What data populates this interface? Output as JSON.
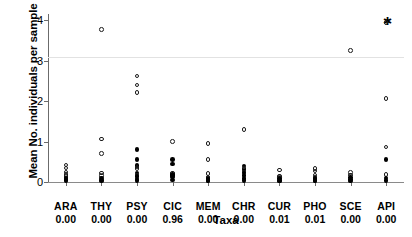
{
  "chart_data": {
    "type": "scatter",
    "title": "",
    "xlabel": "Taxa",
    "ylabel": "Mean No. individuals per sample",
    "ylim": [
      0,
      4.15
    ],
    "yticks": [
      0,
      1,
      2,
      3,
      4
    ],
    "ytick_labels": [
      "0",
      "1",
      "2",
      "3",
      "4"
    ],
    "grid": "single faint horizontal reference line at y = 3.08",
    "gridlines": [
      3.08
    ],
    "legend": "none",
    "legend_position": "none",
    "marker_styles": {
      "open": "open circle",
      "filled": "filled circle",
      "star": "asterisk"
    },
    "categories": [
      "ARA",
      "THY",
      "PSY",
      "CIC",
      "MEM",
      "CHR",
      "CUR",
      "PHO",
      "SCE",
      "API"
    ],
    "category_values": [
      "0.00",
      "0.00",
      "0.00",
      "0.96",
      "0.00",
      "0.00",
      "0.01",
      "0.01",
      "0.00",
      "0.00"
    ],
    "series": [
      {
        "name": "ARA",
        "points": [
          {
            "y": 0.42,
            "style": "open"
          },
          {
            "y": 0.35,
            "style": "open"
          },
          {
            "y": 0.25,
            "style": "open"
          },
          {
            "y": 0.19,
            "style": "open"
          },
          {
            "y": 0.13,
            "style": "open"
          },
          {
            "y": 0.1,
            "style": "filled"
          },
          {
            "y": 0.06,
            "style": "filled"
          },
          {
            "y": 0.03,
            "style": "filled"
          }
        ]
      },
      {
        "name": "THY",
        "points": [
          {
            "y": 3.76,
            "style": "open"
          },
          {
            "y": 1.06,
            "style": "open"
          },
          {
            "y": 0.7,
            "style": "open"
          },
          {
            "y": 0.22,
            "style": "open"
          },
          {
            "y": 0.16,
            "style": "open"
          },
          {
            "y": 0.1,
            "style": "filled"
          },
          {
            "y": 0.05,
            "style": "filled"
          },
          {
            "y": 0.02,
            "style": "filled"
          }
        ]
      },
      {
        "name": "PSY",
        "points": [
          {
            "y": 2.62,
            "style": "open"
          },
          {
            "y": 2.4,
            "style": "open"
          },
          {
            "y": 2.21,
            "style": "open"
          },
          {
            "y": 0.8,
            "style": "filled"
          },
          {
            "y": 0.55,
            "style": "filled"
          },
          {
            "y": 0.41,
            "style": "filled"
          },
          {
            "y": 0.37,
            "style": "open"
          },
          {
            "y": 0.33,
            "style": "open"
          },
          {
            "y": 0.22,
            "style": "filled"
          },
          {
            "y": 0.17,
            "style": "open"
          },
          {
            "y": 0.13,
            "style": "filled"
          },
          {
            "y": 0.07,
            "style": "filled"
          },
          {
            "y": 0.03,
            "style": "filled"
          }
        ]
      },
      {
        "name": "CIC",
        "points": [
          {
            "y": 1.0,
            "style": "open"
          },
          {
            "y": 0.55,
            "style": "filled"
          },
          {
            "y": 0.44,
            "style": "filled"
          },
          {
            "y": 0.22,
            "style": "open"
          },
          {
            "y": 0.18,
            "style": "filled"
          },
          {
            "y": 0.16,
            "style": "filled"
          },
          {
            "y": 0.12,
            "style": "filled"
          },
          {
            "y": 0.05,
            "style": "filled"
          }
        ]
      },
      {
        "name": "MEM",
        "points": [
          {
            "y": 0.95,
            "style": "open"
          },
          {
            "y": 0.55,
            "style": "open"
          },
          {
            "y": 0.21,
            "style": "open"
          },
          {
            "y": 0.12,
            "style": "open"
          },
          {
            "y": 0.08,
            "style": "filled"
          },
          {
            "y": 0.04,
            "style": "filled"
          },
          {
            "y": 0.02,
            "style": "filled"
          }
        ]
      },
      {
        "name": "CHR",
        "points": [
          {
            "y": 1.3,
            "style": "open"
          },
          {
            "y": 0.4,
            "style": "filled"
          },
          {
            "y": 0.33,
            "style": "open"
          },
          {
            "y": 0.3,
            "style": "filled"
          },
          {
            "y": 0.25,
            "style": "open"
          },
          {
            "y": 0.22,
            "style": "filled"
          },
          {
            "y": 0.16,
            "style": "filled"
          },
          {
            "y": 0.09,
            "style": "filled"
          },
          {
            "y": 0.04,
            "style": "filled"
          }
        ]
      },
      {
        "name": "CUR",
        "points": [
          {
            "y": 0.3,
            "style": "open"
          },
          {
            "y": 0.15,
            "style": "open"
          },
          {
            "y": 0.11,
            "style": "open"
          },
          {
            "y": 0.08,
            "style": "filled"
          },
          {
            "y": 0.04,
            "style": "filled"
          },
          {
            "y": 0.02,
            "style": "filled"
          }
        ]
      },
      {
        "name": "PHO",
        "points": [
          {
            "y": 0.33,
            "style": "open"
          },
          {
            "y": 0.27,
            "style": "open"
          },
          {
            "y": 0.17,
            "style": "open"
          },
          {
            "y": 0.12,
            "style": "open"
          },
          {
            "y": 0.08,
            "style": "filled"
          },
          {
            "y": 0.04,
            "style": "filled"
          },
          {
            "y": 0.02,
            "style": "filled"
          }
        ]
      },
      {
        "name": "SCE",
        "points": [
          {
            "y": 3.25,
            "style": "open"
          },
          {
            "y": 0.23,
            "style": "open"
          },
          {
            "y": 0.17,
            "style": "open"
          },
          {
            "y": 0.11,
            "style": "filled"
          },
          {
            "y": 0.06,
            "style": "filled"
          },
          {
            "y": 0.02,
            "style": "filled"
          }
        ]
      },
      {
        "name": "API",
        "points": [
          {
            "y": 3.96,
            "style": "star"
          },
          {
            "y": 3.94,
            "style": "open"
          },
          {
            "y": 2.06,
            "style": "open"
          },
          {
            "y": 0.86,
            "style": "open"
          },
          {
            "y": 0.55,
            "style": "filled"
          },
          {
            "y": 0.18,
            "style": "open"
          },
          {
            "y": 0.1,
            "style": "filled"
          },
          {
            "y": 0.04,
            "style": "filled"
          }
        ]
      }
    ]
  },
  "colors": {
    "marker": "#000000",
    "axis": "#6b6b6b",
    "gridline": "#e2e2e2",
    "background": "#ffffff"
  }
}
